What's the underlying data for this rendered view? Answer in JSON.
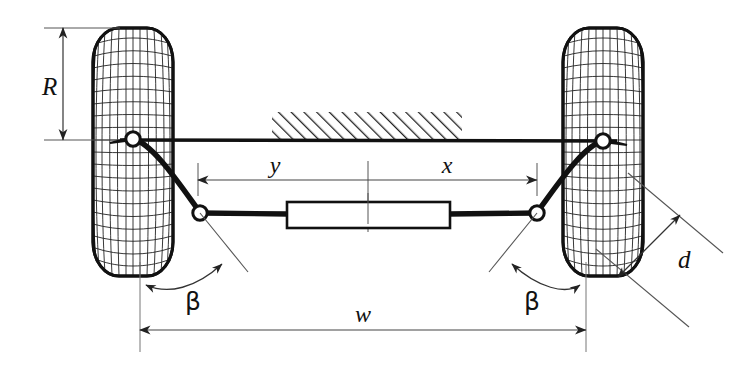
{
  "figure": {
    "kind": "engineering-diagram",
    "background_color": "#ffffff",
    "line_color": "#111111",
    "thin_line_color": "#555555",
    "size": {
      "width": 740,
      "height": 378
    }
  },
  "labels": {
    "wheel_radius": "R",
    "rack_left_offset": "y",
    "rack_right_offset": "x",
    "track_width": "w",
    "steering_arm_offset": "d",
    "steer_angle_left": "β",
    "steer_angle_right": "β"
  },
  "dimensions": [
    {
      "id": "R",
      "label": "R",
      "orientation": "vertical",
      "arrows": "both",
      "from": [
        63,
        28
      ],
      "to": [
        63,
        140
      ]
    },
    {
      "id": "y",
      "label": "y",
      "orientation": "horizontal",
      "arrows": "start",
      "from": [
        198,
        180
      ],
      "to": [
        368,
        180
      ]
    },
    {
      "id": "x",
      "label": "x",
      "orientation": "horizontal",
      "arrows": "end",
      "from": [
        368,
        180
      ],
      "to": [
        537,
        180
      ]
    },
    {
      "id": "w",
      "label": "w",
      "orientation": "horizontal",
      "arrows": "both",
      "from": [
        140,
        330
      ],
      "to": [
        586,
        330
      ]
    },
    {
      "id": "d",
      "label": "d",
      "orientation": "diagonal",
      "arrows": "both",
      "from": [
        619,
        276
      ],
      "to": [
        678,
        216
      ]
    }
  ],
  "angles": [
    {
      "id": "beta-left",
      "label": "β",
      "arrows": "both",
      "vertex": [
        200,
        213
      ],
      "label_pos": [
        193,
        303
      ]
    },
    {
      "id": "beta-right",
      "label": "β",
      "arrows": "both",
      "vertex": [
        537,
        213
      ],
      "label_pos": [
        532,
        303
      ]
    }
  ],
  "components": {
    "left_wheel": {
      "name": "left-front-tire",
      "center": [
        133,
        152
      ],
      "width": 80,
      "height": 248
    },
    "right_wheel": {
      "name": "right-front-tire",
      "center": [
        603,
        152
      ],
      "width": 80,
      "height": 248
    },
    "left_kingpin": {
      "name": "left-kingpin-joint",
      "center": [
        133,
        139
      ]
    },
    "right_kingpin": {
      "name": "right-kingpin-joint",
      "center": [
        603,
        141
      ]
    },
    "left_tie_rod_joint": {
      "name": "left-tie-rod-joint",
      "center": [
        200,
        213
      ]
    },
    "right_tie_rod_joint": {
      "name": "right-tie-rod-joint",
      "center": [
        537,
        213
      ]
    },
    "steering_rack": {
      "name": "steering-rack-body",
      "x": 287,
      "y": 202,
      "width": 163,
      "height": 26
    },
    "axle_beam": {
      "name": "axle-beam",
      "from": [
        120,
        140
      ],
      "to": [
        617,
        141
      ]
    },
    "vehicle_body_hatch": {
      "name": "vehicle-body-hatch",
      "x": 272,
      "y": 112,
      "width": 190,
      "height": 28
    }
  }
}
